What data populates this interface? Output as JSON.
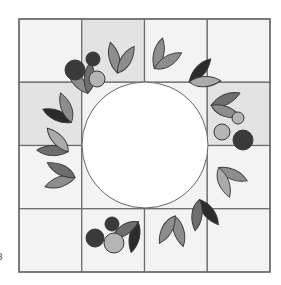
{
  "diagram": {
    "grid": {
      "rows": 4,
      "cols": 4
    },
    "tiles_dark": [
      [
        0,
        1
      ],
      [
        1,
        0
      ],
      [
        3,
        1
      ]
    ],
    "colors": {
      "tile_light": "#f3f3f3",
      "tile_dark": "#e3e3e3",
      "grid_line": "#6b6b6b",
      "center_fill": "#ffffff",
      "center_stroke": "#666666",
      "outline": "#3a3a3a",
      "leaf_black": "#2b2b2b",
      "leaf_dark": "#6e6e6e",
      "leaf_mid": "#8d8d8d",
      "leaf_light": "#ababab",
      "berry_dark": "#3a3a3a",
      "berry_light": "#b5b5b5"
    },
    "leaf_pairs": [
      {
        "angle": -108,
        "a": "leaf_mid",
        "b": "leaf_mid"
      },
      {
        "angle": -80,
        "a": "leaf_mid",
        "b": "leaf_mid"
      },
      {
        "angle": -52,
        "a": "leaf_black",
        "b": "leaf_light"
      },
      {
        "angle": -28,
        "a": "leaf_dark",
        "b": "leaf_mid"
      },
      {
        "angle": 20,
        "a": "leaf_mid",
        "b": "leaf_light"
      },
      {
        "angle": 48,
        "a": "leaf_black",
        "b": "leaf_dark"
      },
      {
        "angle": 70,
        "a": "leaf_mid",
        "b": "leaf_mid"
      },
      {
        "angle": 98,
        "a": "leaf_black",
        "b": "leaf_dark"
      },
      {
        "angle": 158,
        "a": "leaf_mid",
        "b": "leaf_dark"
      },
      {
        "angle": 178,
        "a": "leaf_dark",
        "b": "leaf_light"
      },
      {
        "angle": 200,
        "a": "leaf_black",
        "b": "leaf_mid"
      },
      {
        "angle": 225,
        "a": "leaf_mid",
        "b": "leaf_dark"
      }
    ],
    "berry_clusters": [
      {
        "position": "top-left",
        "berries": [
          "berry_dark",
          "berry_dark",
          "berry_light"
        ]
      },
      {
        "position": "right",
        "berries": [
          "berry_light",
          "berry_light",
          "berry_dark"
        ]
      },
      {
        "position": "bottom-left",
        "berries": [
          "berry_dark",
          "berry_dark",
          "berry_light"
        ]
      }
    ]
  },
  "page_number": "3"
}
